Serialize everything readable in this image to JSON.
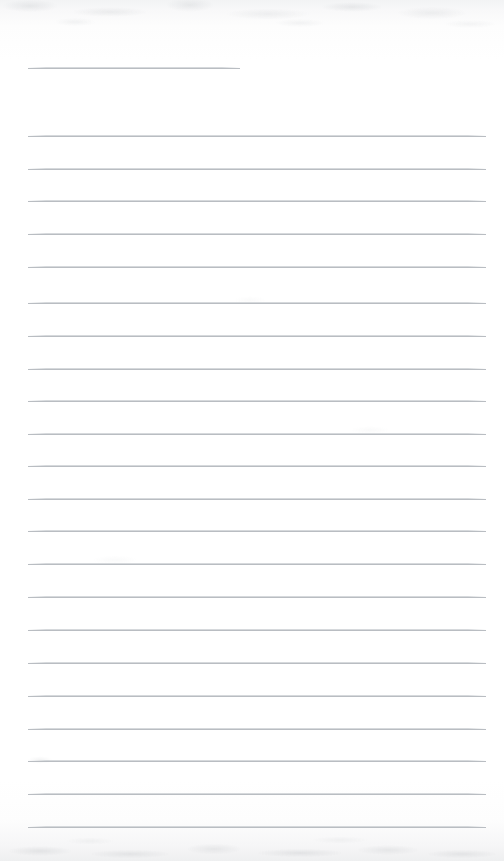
{
  "document": {
    "kind": "scanned-lined-paper",
    "title_text": "",
    "body_text": "",
    "page_width": 504,
    "page_height": 861,
    "paper_color": "#ffffff",
    "rule_color": "#b9bdc2",
    "rule_halo_color": "#c8ccd0",
    "scan_noise_color": "#969ba0",
    "total_rules": 24,
    "filled_rules": 0
  },
  "layout": {
    "margin_left": 28,
    "margin_right": 486,
    "title_rule_right": 240,
    "first_rule_y": 68,
    "line_spacing": 32.5
  },
  "rules": [
    {
      "name": "title-rule",
      "index": 0,
      "y": 68,
      "left": 28,
      "right": 240,
      "full_width": false,
      "content": ""
    },
    {
      "name": "body-rule",
      "index": 1,
      "y": 136,
      "left": 28,
      "right": 486,
      "full_width": true,
      "content": ""
    },
    {
      "name": "body-rule",
      "index": 2,
      "y": 169,
      "left": 28,
      "right": 486,
      "full_width": true,
      "content": ""
    },
    {
      "name": "body-rule",
      "index": 3,
      "y": 201,
      "left": 28,
      "right": 486,
      "full_width": true,
      "content": ""
    },
    {
      "name": "body-rule",
      "index": 4,
      "y": 234,
      "left": 28,
      "right": 486,
      "full_width": true,
      "content": ""
    },
    {
      "name": "body-rule",
      "index": 5,
      "y": 267,
      "left": 28,
      "right": 486,
      "full_width": true,
      "content": ""
    },
    {
      "name": "body-rule",
      "index": 6,
      "y": 303,
      "left": 28,
      "right": 486,
      "full_width": true,
      "content": ""
    },
    {
      "name": "body-rule",
      "index": 7,
      "y": 336,
      "left": 28,
      "right": 486,
      "full_width": true,
      "content": ""
    },
    {
      "name": "body-rule",
      "index": 8,
      "y": 369,
      "left": 28,
      "right": 486,
      "full_width": true,
      "content": ""
    },
    {
      "name": "body-rule",
      "index": 9,
      "y": 401,
      "left": 28,
      "right": 486,
      "full_width": true,
      "content": ""
    },
    {
      "name": "body-rule",
      "index": 10,
      "y": 434,
      "left": 28,
      "right": 486,
      "full_width": true,
      "content": ""
    },
    {
      "name": "body-rule",
      "index": 11,
      "y": 466,
      "left": 28,
      "right": 486,
      "full_width": true,
      "content": ""
    },
    {
      "name": "body-rule",
      "index": 12,
      "y": 499,
      "left": 28,
      "right": 486,
      "full_width": true,
      "content": ""
    },
    {
      "name": "body-rule",
      "index": 13,
      "y": 531,
      "left": 28,
      "right": 486,
      "full_width": true,
      "content": ""
    },
    {
      "name": "body-rule",
      "index": 14,
      "y": 564,
      "left": 28,
      "right": 486,
      "full_width": true,
      "content": ""
    },
    {
      "name": "body-rule",
      "index": 15,
      "y": 597,
      "left": 28,
      "right": 486,
      "full_width": true,
      "content": ""
    },
    {
      "name": "body-rule",
      "index": 16,
      "y": 630,
      "left": 28,
      "right": 486,
      "full_width": true,
      "content": ""
    },
    {
      "name": "body-rule",
      "index": 17,
      "y": 663,
      "left": 28,
      "right": 486,
      "full_width": true,
      "content": ""
    },
    {
      "name": "body-rule",
      "index": 18,
      "y": 696,
      "left": 28,
      "right": 486,
      "full_width": true,
      "content": ""
    },
    {
      "name": "body-rule",
      "index": 19,
      "y": 729,
      "left": 28,
      "right": 486,
      "full_width": true,
      "content": ""
    },
    {
      "name": "body-rule",
      "index": 20,
      "y": 761,
      "left": 28,
      "right": 486,
      "full_width": true,
      "content": ""
    },
    {
      "name": "body-rule",
      "index": 21,
      "y": 794,
      "left": 28,
      "right": 486,
      "full_width": true,
      "content": ""
    },
    {
      "name": "body-rule",
      "index": 22,
      "y": 827,
      "left": 28,
      "right": 486,
      "full_width": true,
      "content": ""
    }
  ]
}
